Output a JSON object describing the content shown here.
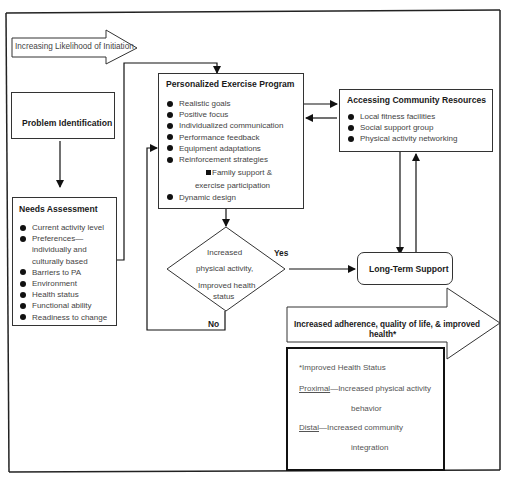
{
  "initiation_arrow": {
    "label": "Increasing Likelihood of Initiation"
  },
  "problem_identification": {
    "title": "Problem Identification"
  },
  "needs_assessment": {
    "title": "Needs Assessment",
    "items": [
      "Current activity level",
      "Preferences— individually and culturally based",
      "Barriers to PA",
      "Environment",
      "Health status",
      "Functional ability",
      "Readiness to change"
    ]
  },
  "exercise_program": {
    "title": "Personalized Exercise Program",
    "items": [
      "Realistic goals",
      "Positive focus",
      "Individualized communication",
      "Performance feedback",
      "Equipment adaptations",
      "Reinforcement strategies"
    ],
    "sub_item_line1": "Family support &",
    "sub_item_line2": "exercise participation",
    "last_item": "Dynamic design"
  },
  "community_resources": {
    "title": "Accessing Community Resources",
    "items": [
      "Local fitness facilities",
      "Social support group",
      "Physical activity networking"
    ]
  },
  "decision": {
    "line1": "Increased",
    "line2": "physical activity,",
    "line3": "Improved health",
    "line4": "status",
    "yes_label": "Yes",
    "no_label": "No"
  },
  "long_term_support": {
    "title": "Long-Term Support"
  },
  "outcome_arrow": {
    "line1": "Increased adherence, quality of life, & improved",
    "line2": "health*"
  },
  "health_status_note": {
    "title": "*Improved Health Status",
    "proximal_term": "Proximal",
    "proximal_text": "—Increased physical activity",
    "proximal_cont": "behavior",
    "distal_term": "Distal",
    "distal_text": "—Increased community",
    "distal_cont": "integration"
  }
}
